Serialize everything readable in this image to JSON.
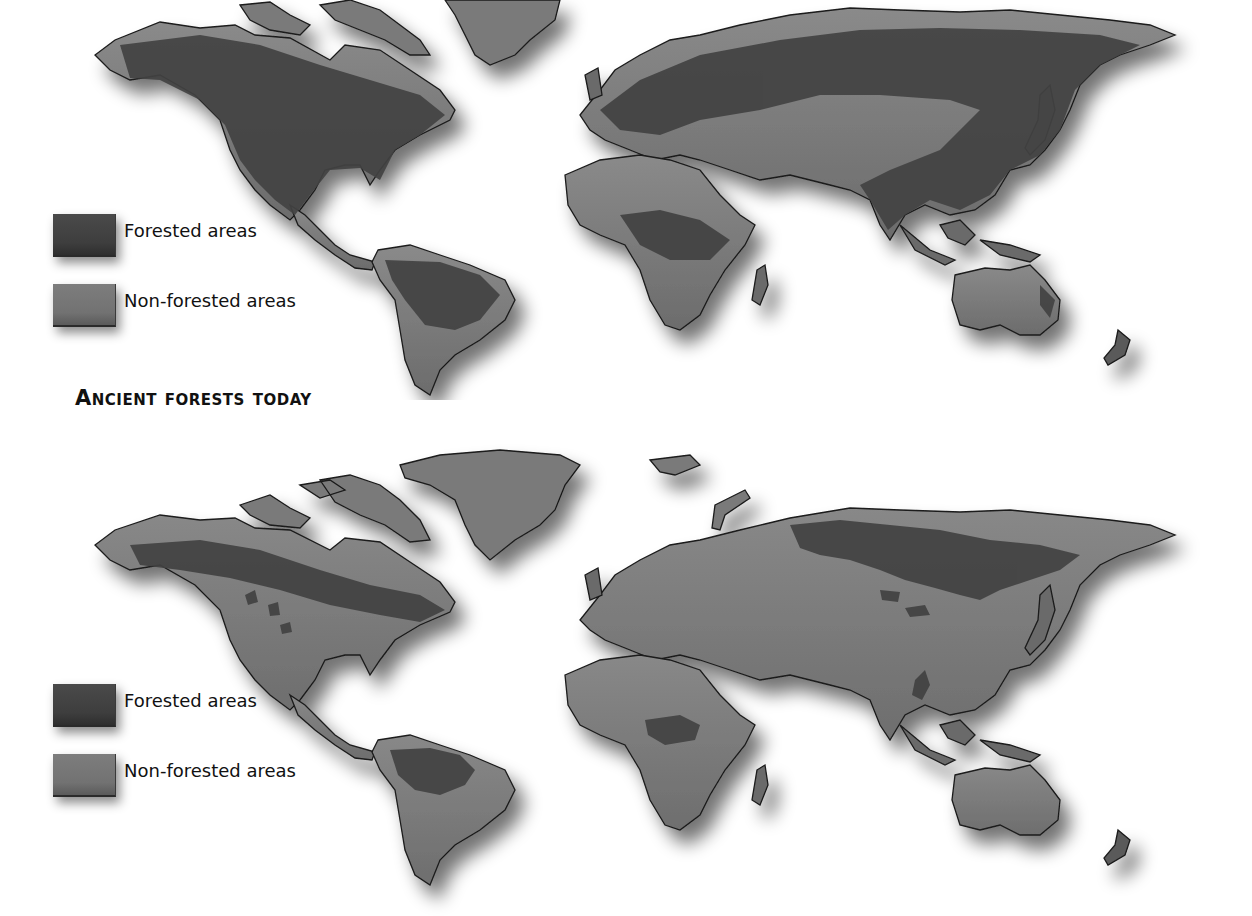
{
  "figure": {
    "section_title": "Ancient forests today",
    "colors": {
      "forested": "#424242",
      "non_forested": "#767676",
      "background": "#ffffff",
      "coastline": "#1a1a1a"
    }
  },
  "maps": [
    {
      "id": "past",
      "description": "World map of original (historical) forest cover",
      "title": "",
      "legend": [
        {
          "key": "forested",
          "label": "Forested areas"
        },
        {
          "key": "non_forested",
          "label": "Non-forested areas"
        }
      ]
    },
    {
      "id": "today",
      "description": "World map of ancient forests remaining today",
      "title": "Ancient forests today",
      "legend": [
        {
          "key": "forested",
          "label": "Forested areas"
        },
        {
          "key": "non_forested",
          "label": "Non-forested areas"
        }
      ]
    }
  ]
}
